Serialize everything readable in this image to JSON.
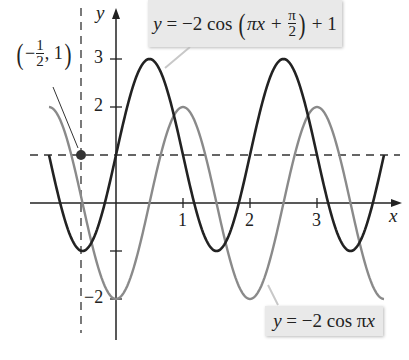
{
  "chart_data": {
    "type": "line",
    "title": "",
    "xlabel": "x",
    "ylabel": "y",
    "xlim": [
      -1.0,
      4.2
    ],
    "ylim": [
      -2.3,
      3.6
    ],
    "x_ticks": [
      1,
      2,
      3
    ],
    "x_tick_labels": [
      "1",
      "2",
      "3"
    ],
    "y_ticks": [
      -2,
      -1,
      2,
      3
    ],
    "y_tick_labels": [
      "−2",
      "",
      "2",
      "3"
    ],
    "grid": false,
    "series": [
      {
        "name": "y = −2 cos(πx + π/2) + 1",
        "formula": "-2*cos(pi*x + pi/2) + 1",
        "color": "#222222",
        "x_range": [
          -1,
          4
        ],
        "x": [
          -1,
          -0.5,
          0,
          0.5,
          1,
          1.5,
          2,
          2.5,
          3,
          3.5,
          4
        ],
        "values": [
          1,
          -1,
          1,
          3,
          1,
          -1,
          1,
          3,
          1,
          -1,
          1
        ]
      },
      {
        "name": "y = −2 cos πx",
        "formula": "-2*cos(pi*x)",
        "color": "#8a8a8a",
        "x_range": [
          -1,
          4
        ],
        "x": [
          -1,
          -0.5,
          0,
          0.5,
          1,
          1.5,
          2,
          2.5,
          3,
          3.5,
          4
        ],
        "values": [
          2,
          0,
          -2,
          0,
          2,
          0,
          -2,
          0,
          2,
          0,
          -2
        ]
      }
    ],
    "reference_lines": [
      {
        "type": "horizontal",
        "y": 1,
        "style": "dashed"
      },
      {
        "type": "vertical",
        "x": -0.5,
        "style": "dashed"
      }
    ],
    "annotations": [
      {
        "text": "(−1/2, 1)",
        "point": [
          -0.5,
          1
        ],
        "marker": "filled-circle"
      },
      {
        "text": "y = −2 cos(πx + π/2) + 1",
        "target_series": 0
      },
      {
        "text": "y = −2 cos πx",
        "target_series": 1
      }
    ],
    "legend": "none (callout labels)"
  },
  "labels": {
    "x_axis": "x",
    "y_axis": "y",
    "tick_1": "1",
    "tick_2": "2",
    "tick_3": "3",
    "ytick_3": "3",
    "ytick_2": "2",
    "ytick_neg2": "−2",
    "point_x_num": "1",
    "point_x_den": "2",
    "point_minus": "−",
    "point_y": "1",
    "top_callout": {
      "y": "y",
      "eq": " = −2 cos ",
      "pix": "πx + ",
      "num": "π",
      "den": "2",
      "tail": " + 1"
    },
    "bottom_callout": {
      "y": "y",
      "eq": " = −2 cos π",
      "x": "x"
    }
  },
  "colors": {
    "dark_curve": "#222222",
    "gray_curve": "#8a8a8a",
    "callout_bg": "#e9e9e9",
    "axis": "#222222"
  }
}
